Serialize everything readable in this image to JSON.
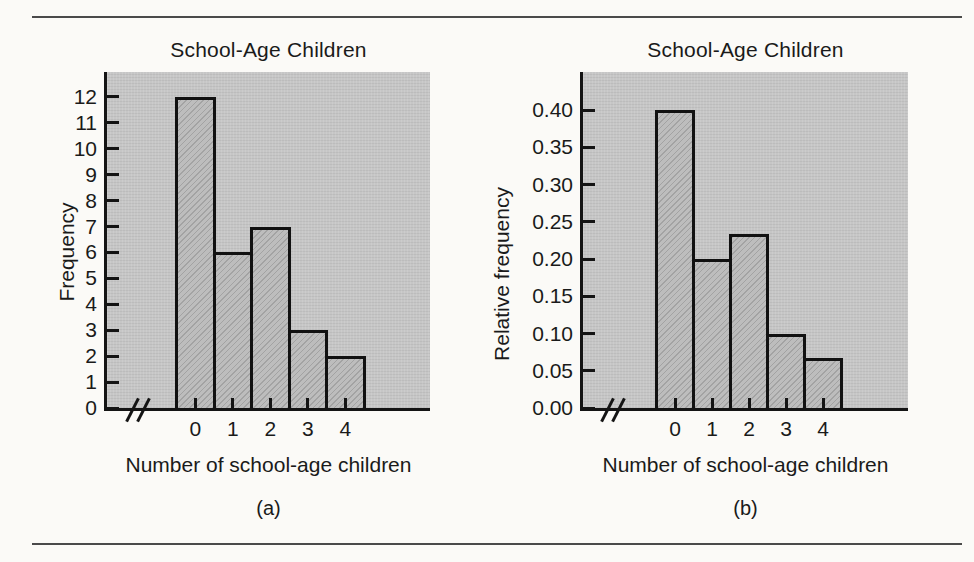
{
  "colors": {
    "page_background": "#fbfaf7",
    "rule": "#4a4a4a",
    "plot_background": "#c6c6c6",
    "bar_fill": "#bdbdbd",
    "axis_line": "#141414",
    "text": "#1a1a1a"
  },
  "chart_data": [
    {
      "type": "bar",
      "title": "School-Age Children",
      "xlabel": "Number of school-age children",
      "ylabel": "Frequency",
      "panel_label": "(a)",
      "categories": [
        "0",
        "1",
        "2",
        "3",
        "4"
      ],
      "values": [
        12,
        6,
        7,
        3,
        2
      ],
      "yticks": [
        "0",
        "1",
        "2",
        "3",
        "4",
        "5",
        "6",
        "7",
        "8",
        "9",
        "10",
        "11",
        "12"
      ],
      "ylim": [
        0,
        13
      ],
      "axis_break": true,
      "grid": false,
      "legend": false
    },
    {
      "type": "bar",
      "title": "School-Age Children",
      "xlabel": "Number of school-age children",
      "ylabel": "Relative frequency",
      "panel_label": "(b)",
      "categories": [
        "0",
        "1",
        "2",
        "3",
        "4"
      ],
      "values": [
        0.4,
        0.2,
        0.233,
        0.1,
        0.067
      ],
      "yticks": [
        "0.00",
        "0.05",
        "0.10",
        "0.15",
        "0.20",
        "0.25",
        "0.30",
        "0.35",
        "0.40"
      ],
      "ylim": [
        0,
        0.45
      ],
      "axis_break": true,
      "grid": false,
      "legend": false
    }
  ]
}
